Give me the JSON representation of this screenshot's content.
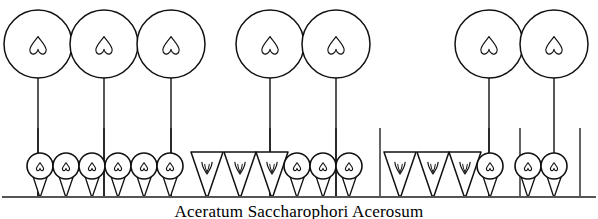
{
  "figure": {
    "title": "Aceratum Saccharophori Acerosum",
    "kind": "vegetation-profile-diagram",
    "width": 598,
    "height": 219,
    "stroke_color": "#111111",
    "background_color": "#ffffff",
    "ground_line_color": "#555555"
  },
  "canopy": {
    "label": "tree-canopy-row",
    "crown_radius": 34,
    "center_y": 44,
    "trunk_bottom_y": 196,
    "leaf_glyph": "heart-leaf",
    "trees": [
      {
        "id": "tree-1",
        "cx": 38,
        "cy": 44,
        "r": 34,
        "trunk_x": 38,
        "leaf": "heart-leaf"
      },
      {
        "id": "tree-2",
        "cx": 104,
        "cy": 44,
        "r": 34,
        "trunk_x": 104,
        "leaf": "heart-leaf"
      },
      {
        "id": "tree-3",
        "cx": 171,
        "cy": 44,
        "r": 34,
        "trunk_x": 171,
        "leaf": "heart-leaf"
      },
      {
        "id": "tree-4",
        "cx": 270,
        "cy": 44,
        "r": 34,
        "trunk_x": 270,
        "leaf": "heart-leaf"
      },
      {
        "id": "tree-5",
        "cx": 336,
        "cy": 44,
        "r": 34,
        "trunk_x": 336,
        "leaf": "heart-leaf"
      },
      {
        "id": "tree-6",
        "cx": 489,
        "cy": 44,
        "r": 34,
        "trunk_x": 489,
        "leaf": "heart-leaf"
      },
      {
        "id": "tree-7",
        "cx": 554,
        "cy": 44,
        "r": 34,
        "trunk_x": 554,
        "leaf": "heart-leaf"
      }
    ]
  },
  "understory": {
    "label": "shrub-sapling-row",
    "baseline_y": 196,
    "unit_top_y": 152,
    "sapling": {
      "glyph": "circle-on-cone",
      "circle_r": 13,
      "circle_cy": 166,
      "leaf": "heart-leaf",
      "cone_bottom_y": 196
    },
    "conifer": {
      "glyph": "inverted-triangle",
      "top_y": 152,
      "bottom_y": 196,
      "half_width": 16,
      "mark": "v-leaf"
    },
    "units": [
      {
        "id": "u1",
        "type": "sapling",
        "x": 40
      },
      {
        "id": "u2",
        "type": "sapling",
        "x": 66
      },
      {
        "id": "u3",
        "type": "sapling",
        "x": 92
      },
      {
        "id": "u4",
        "type": "sapling",
        "x": 118
      },
      {
        "id": "u5",
        "type": "sapling",
        "x": 144
      },
      {
        "id": "u6",
        "type": "sapling",
        "x": 170
      },
      {
        "id": "u7",
        "type": "conifer",
        "x": 207
      },
      {
        "id": "u8",
        "type": "conifer",
        "x": 240
      },
      {
        "id": "u9",
        "type": "conifer",
        "x": 272
      },
      {
        "id": "u10",
        "type": "sapling",
        "x": 297
      },
      {
        "id": "u11",
        "type": "sapling",
        "x": 323
      },
      {
        "id": "u12",
        "type": "sapling",
        "x": 349
      },
      {
        "id": "u13",
        "type": "conifer",
        "x": 400
      },
      {
        "id": "u14",
        "type": "conifer",
        "x": 433
      },
      {
        "id": "u15",
        "type": "conifer",
        "x": 465
      },
      {
        "id": "u16",
        "type": "sapling",
        "x": 490
      },
      {
        "id": "u17",
        "type": "sapling",
        "x": 528
      },
      {
        "id": "u18",
        "type": "sapling",
        "x": 554
      }
    ]
  },
  "plot_dividers": {
    "label": "quadrat-boundary-lines",
    "top_y": 128,
    "bottom_y": 196,
    "x_positions": [
      38,
      104,
      171,
      270,
      336,
      380,
      489,
      520,
      580
    ]
  },
  "ground_line": {
    "label": "ground-baseline",
    "y": 197,
    "x_start": 2,
    "x_end": 596
  }
}
